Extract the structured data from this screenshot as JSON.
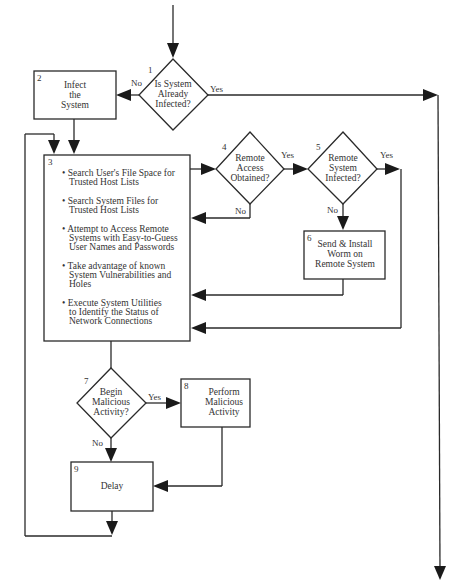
{
  "diagram": {
    "nodes": [
      {
        "id": "1",
        "type": "decision",
        "lines": [
          "Is System",
          "Already",
          "Infected?"
        ]
      },
      {
        "id": "2",
        "type": "process",
        "lines": [
          "Infect",
          "the",
          "System"
        ]
      },
      {
        "id": "3",
        "type": "process",
        "bullets": [
          [
            "• Search User's File Space for",
            "Trusted Host Lists"
          ],
          [
            "• Search System Files for",
            "Trusted Host Lists"
          ],
          [
            "• Attempt to Access Remote",
            "Systems with Easy-to-Guess",
            "User Names and Passwords"
          ],
          [
            "• Take advantage of known",
            "System Vulnerabilities and",
            "Holes"
          ],
          [
            "• Execute System Utilities",
            "to Identify the Status of",
            "Network Connections"
          ]
        ]
      },
      {
        "id": "4",
        "type": "decision",
        "lines": [
          "Remote",
          "Access",
          "Obtained?"
        ]
      },
      {
        "id": "5",
        "type": "decision",
        "lines": [
          "Remote",
          "System",
          "Infected?"
        ]
      },
      {
        "id": "6",
        "type": "process",
        "lines": [
          "Send & Install",
          "Worm on",
          "Remote System"
        ]
      },
      {
        "id": "7",
        "type": "decision",
        "lines": [
          "Begin",
          "Malicious",
          "Activity?"
        ]
      },
      {
        "id": "8",
        "type": "process",
        "lines": [
          "Perform",
          "Malicious",
          "Activity"
        ]
      },
      {
        "id": "9",
        "type": "process",
        "lines": [
          "Delay"
        ]
      }
    ],
    "edge_labels": {
      "d1_no": "No",
      "d1_yes": "Yes",
      "d4_yes": "Yes",
      "d4_no": "No",
      "d5_yes": "Yes",
      "d5_no": "No",
      "d7_yes": "Yes",
      "d7_no": "No"
    }
  }
}
